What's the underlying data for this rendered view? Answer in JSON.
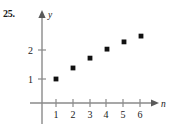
{
  "figure": {
    "problem_number": "25.",
    "background_color": "#ffffff",
    "axis_color": "#8a8a8a",
    "point_color": "#111111",
    "text_color": "#1a1a1a"
  },
  "chart_data": {
    "type": "scatter",
    "title": "",
    "xlabel": "n",
    "ylabel": "y",
    "x": [
      1,
      2,
      3,
      4,
      5,
      6
    ],
    "values": [
      1.0,
      1.38,
      1.72,
      2.03,
      2.28,
      2.48
    ],
    "series": [
      {
        "name": "sequence",
        "values": [
          1.0,
          1.38,
          1.72,
          2.03,
          2.28,
          2.48
        ]
      }
    ],
    "xticks": [
      1,
      2,
      3,
      4,
      5,
      6
    ],
    "xtick_labels": [
      "1",
      "2",
      "3",
      "4",
      "5",
      "6"
    ],
    "yticks": [
      1,
      2
    ],
    "ytick_labels": [
      "1",
      "2"
    ],
    "xlim": [
      0,
      6.9
    ],
    "ylim": [
      -0.55,
      3.0
    ],
    "grid": false,
    "legend": false,
    "legend_position": "none",
    "axis_arrows": true,
    "marker": "square-dot"
  }
}
